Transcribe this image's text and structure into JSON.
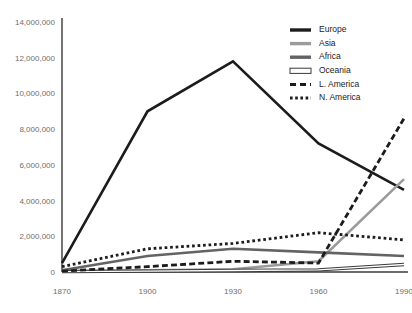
{
  "chart_data": {
    "type": "line",
    "title": "",
    "subtitle": "",
    "xlabel": "",
    "ylabel": "",
    "x": [
      1870,
      1900,
      1930,
      1960,
      1990
    ],
    "xtick_labels": [
      "1870",
      "1900",
      "1930",
      "1960",
      "1990"
    ],
    "ytick_labels": [
      "0",
      "2,000,000",
      "4,000,000",
      "6,000,000",
      "8,000,000",
      "10,000,000",
      "12,000,000",
      "14,000,000"
    ],
    "ytick_values": [
      0,
      2000000,
      4000000,
      6000000,
      8000000,
      10000000,
      12000000,
      14000000
    ],
    "ylim": [
      0,
      14000000
    ],
    "xlim": [
      1870,
      1990
    ],
    "grid": false,
    "legend_position": "top-right",
    "series": [
      {
        "name": "Europe",
        "style": "solid",
        "color": "#1c1c1c",
        "width": 2.6,
        "values": [
          500000,
          9000000,
          11800000,
          7200000,
          4600000
        ]
      },
      {
        "name": "Asia",
        "style": "solid",
        "color": "#9b9b9b",
        "width": 2.6,
        "values": [
          50000,
          100000,
          150000,
          600000,
          5200000
        ]
      },
      {
        "name": "Africa",
        "style": "solid",
        "color": "#636363",
        "width": 2.6,
        "values": [
          100000,
          900000,
          1300000,
          1100000,
          900000
        ]
      },
      {
        "name": "Oceania",
        "style": "outline",
        "color": "#ffffff",
        "outline_color": "#3a3a3a",
        "width": 3.4,
        "values": [
          20000,
          50000,
          80000,
          120000,
          420000
        ]
      },
      {
        "name": "L. America",
        "style": "dashed",
        "color": "#1c1c1c",
        "width": 2.8,
        "values": [
          50000,
          300000,
          600000,
          500000,
          8600000
        ]
      },
      {
        "name": "N. America",
        "style": "dotted",
        "color": "#1c1c1c",
        "width": 2.8,
        "values": [
          300000,
          1300000,
          1600000,
          2200000,
          1800000
        ]
      }
    ]
  },
  "legend": {
    "items": [
      {
        "label": "Europe"
      },
      {
        "label": "Asia"
      },
      {
        "label": "Africa"
      },
      {
        "label": "Oceania"
      },
      {
        "label": "L. America"
      },
      {
        "label": "N. America"
      }
    ]
  },
  "caption": {
    "text": ""
  }
}
